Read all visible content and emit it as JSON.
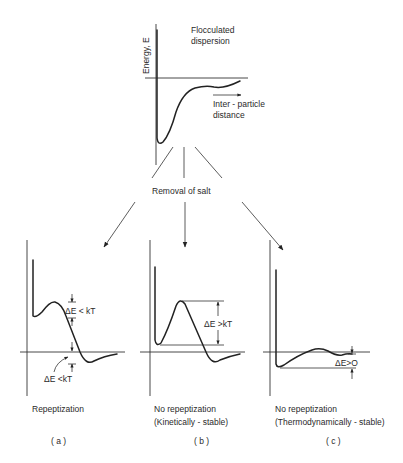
{
  "top": {
    "title_line1": "Flocculated",
    "title_line2": "dispersion",
    "y_axis_label": "Energy, E",
    "x_axis_label_line1": "Inter - particle",
    "x_axis_label_line2": "distance"
  },
  "transition": {
    "label": "Removal of salt"
  },
  "panels": [
    {
      "id": "a",
      "annotation_barrier": "ΔE < kT",
      "annotation_well": "ΔE <kT",
      "caption_line1": "Repeptization",
      "caption_line2": "",
      "tag": "( a )"
    },
    {
      "id": "b",
      "annotation_barrier": "ΔE >kT",
      "caption_line1": "No repeptization",
      "caption_line2": "(Kinetically - stable)",
      "tag": "( b )"
    },
    {
      "id": "c",
      "annotation_well": "ΔE>O",
      "caption_line1": "No repeptization",
      "caption_line2": "(Thermodynamically - stable)",
      "tag": "( c )"
    }
  ],
  "colors": {
    "ink": "#222222",
    "background": "#ffffff"
  }
}
